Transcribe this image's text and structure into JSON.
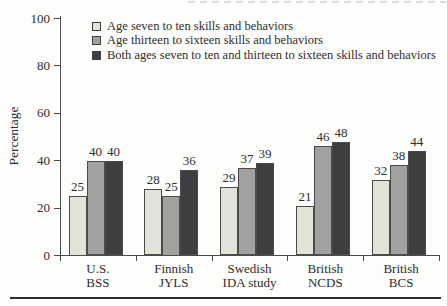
{
  "chart_data": {
    "type": "bar",
    "title": "",
    "xlabel": "",
    "ylabel": "Percentage",
    "ylim": [
      0,
      100
    ],
    "yticks": [
      0,
      20,
      40,
      60,
      80,
      100
    ],
    "grid": false,
    "legend_position": "top-inside",
    "value_labels": true,
    "categories": [
      "U.S. BSS",
      "Finnish JYLS",
      "Swedish IDA study",
      "British NCDS",
      "British BCS"
    ],
    "category_lines": [
      [
        "U.S.",
        "BSS"
      ],
      [
        "Finnish",
        "JYLS"
      ],
      [
        "Swedish",
        "IDA study"
      ],
      [
        "British",
        "NCDS"
      ],
      [
        "British",
        "BCS"
      ]
    ],
    "series": [
      {
        "name": "Age seven to ten skills and behaviors",
        "color": "#e3e2d9",
        "values": [
          25,
          28,
          29,
          21,
          32
        ]
      },
      {
        "name": "Age thirteen to sixteen skills and behaviors",
        "color": "#a1a19f",
        "values": [
          40,
          25,
          37,
          46,
          38
        ]
      },
      {
        "name": "Both ages seven to ten and thirteen to sixteen skills and behaviors",
        "color": "#3e3e40",
        "values": [
          40,
          36,
          39,
          48,
          44
        ]
      }
    ],
    "colors": {
      "axis": "#4a4a4a",
      "bar_border": "#4b4b4b",
      "text": "#2e2e2e",
      "background": "#fdfdfb",
      "bottom_rule": "#2f2f2f"
    }
  }
}
